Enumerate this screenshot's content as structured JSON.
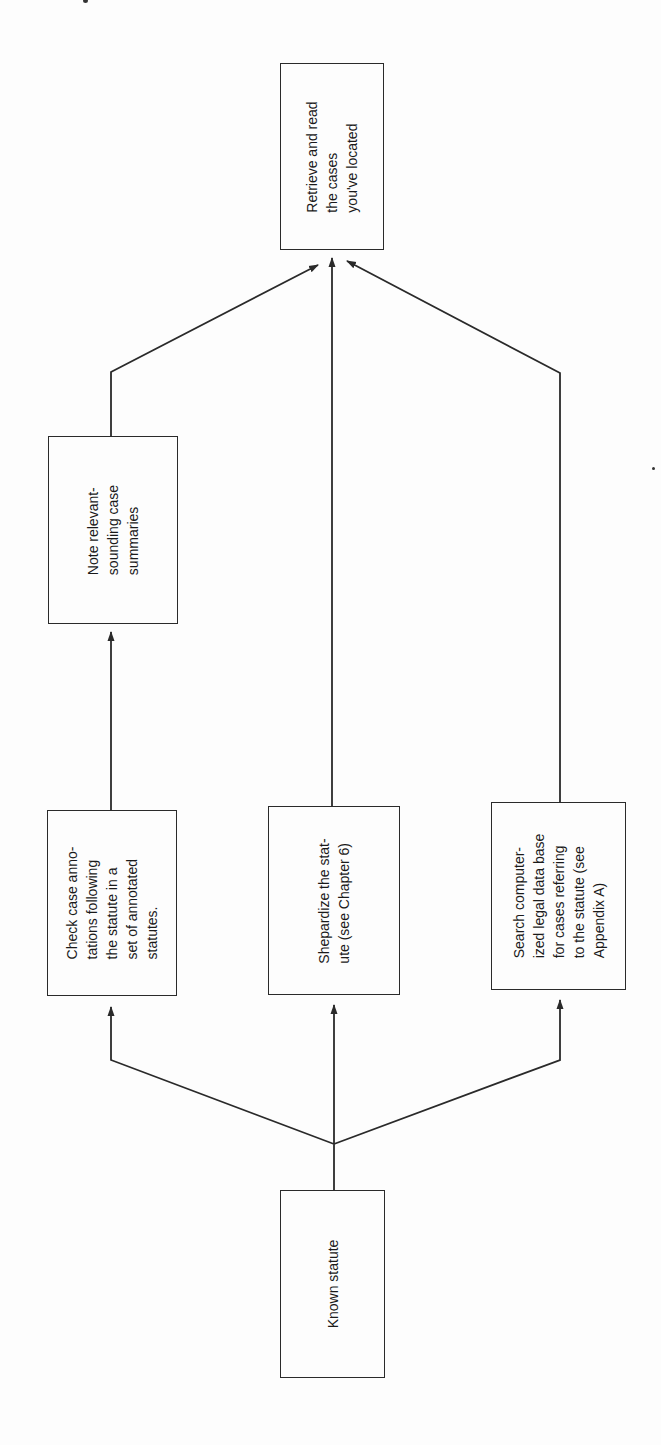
{
  "diagram": {
    "type": "flowchart",
    "orientation": "rotated-90-ccw",
    "colors": {
      "stroke": "#2a2a2a",
      "background": "#fdfdfd",
      "text": "#1a1a1a"
    },
    "nodes": {
      "known_statute": {
        "lines": [
          "Known statute"
        ],
        "box": {
          "x": 280,
          "y": 1190,
          "w": 105,
          "h": 188
        }
      },
      "check_annotations": {
        "lines": [
          "Check case anno-",
          "tations following",
          "the statute in a",
          "set of annotated",
          "statutes."
        ],
        "box": {
          "x": 47,
          "y": 810,
          "w": 130,
          "h": 186
        }
      },
      "shepardize": {
        "lines": [
          "Shepardize the stat-",
          "ute (see Chapter 6)"
        ],
        "box": {
          "x": 268,
          "y": 806,
          "w": 132,
          "h": 189
        }
      },
      "search_database": {
        "lines": [
          "Search computer-",
          "ized legal data base",
          "for cases referring",
          "to the statute (see",
          "Appendix A)"
        ],
        "box": {
          "x": 491,
          "y": 802,
          "w": 135,
          "h": 188
        }
      },
      "note_summaries": {
        "lines": [
          "Note relevant-",
          "sounding case",
          "summaries"
        ],
        "box": {
          "x": 48,
          "y": 436,
          "w": 130,
          "h": 188
        }
      },
      "retrieve_cases": {
        "lines": [
          "Retrieve and read",
          "the cases",
          "you've located"
        ],
        "box": {
          "x": 280,
          "y": 63,
          "w": 104,
          "h": 187
        }
      }
    },
    "edges": [
      {
        "from": "known_statute",
        "to": "check_annotations",
        "points": [
          [
            334,
            1190
          ],
          [
            334,
            1144
          ],
          [
            111,
            1060
          ],
          [
            111,
            1007
          ]
        ],
        "arrow": true
      },
      {
        "from": "known_statute",
        "to": "shepardize",
        "points": [
          [
            334,
            1144
          ],
          [
            334,
            1005
          ]
        ],
        "arrow": true
      },
      {
        "from": "known_statute",
        "to": "search_database",
        "points": [
          [
            334,
            1144
          ],
          [
            560,
            1060
          ],
          [
            560,
            1000
          ]
        ],
        "arrow": true
      },
      {
        "from": "check_annotations",
        "to": "note_summaries",
        "points": [
          [
            111,
            810
          ],
          [
            111,
            632
          ]
        ],
        "arrow": true
      },
      {
        "from": "note_summaries",
        "to": "retrieve_cases",
        "points": [
          [
            111,
            436
          ],
          [
            111,
            372
          ],
          [
            318,
            265
          ]
        ],
        "arrow": true
      },
      {
        "from": "shepardize",
        "to": "retrieve_cases",
        "points": [
          [
            332,
            806
          ],
          [
            332,
            258
          ]
        ],
        "arrow": true
      },
      {
        "from": "search_database",
        "to": "retrieve_cases",
        "points": [
          [
            560,
            802
          ],
          [
            560,
            373
          ],
          [
            347,
            261
          ]
        ],
        "arrow": true
      }
    ]
  }
}
